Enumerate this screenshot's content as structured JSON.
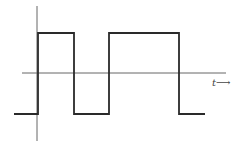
{
  "diagram": {
    "type": "square-wave",
    "axis_label": "t⟶",
    "colors": {
      "wave": "#2a2a2a",
      "axis": "#666666",
      "background": "#ffffff"
    },
    "wave_points": [
      [
        14,
        114
      ],
      [
        38,
        114
      ],
      [
        38,
        33
      ],
      [
        74,
        33
      ],
      [
        74,
        114
      ],
      [
        109,
        114
      ],
      [
        109,
        33
      ],
      [
        179,
        33
      ],
      [
        179,
        114
      ],
      [
        205,
        114
      ]
    ],
    "axes": {
      "horizontal": {
        "x1": 22,
        "y": 73,
        "x2": 226
      },
      "vertical": {
        "x": 37,
        "y1": 6,
        "y2": 141
      }
    }
  }
}
